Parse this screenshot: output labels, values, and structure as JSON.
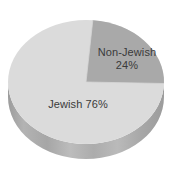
{
  "chart_data": {
    "type": "pie",
    "effect": "3d",
    "title": "",
    "categories": [
      "Jewish",
      "Non-Jewish"
    ],
    "values": [
      76,
      24
    ],
    "unit": "%",
    "start_angle_deg": 5,
    "clockwise": true,
    "legend": "none",
    "labels": {
      "jewish": {
        "text": "Jewish 76%"
      },
      "non_jewish": {
        "line1": "Non-Jewish",
        "line2": "24%"
      }
    },
    "colors": {
      "jewish_slice": "#dbdbdb",
      "non_jewish_slice": "#a9a9a9",
      "side": "#b3b3b3",
      "side_dark": "#9c9c9c",
      "separator": "#d6d6d6",
      "label_text": "#3a3a3a",
      "background": "#ffffff"
    }
  }
}
